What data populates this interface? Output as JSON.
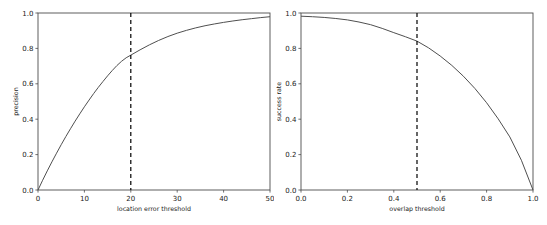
{
  "figure": {
    "background": "#ffffff",
    "curve_color": "#4f4f4f",
    "axis_color": "#4d4d4d",
    "threshold_color": "#000000",
    "width": 547,
    "height": 225
  },
  "chart_data": [
    {
      "type": "line",
      "panel": "left",
      "title": "",
      "xlabel": "location error threshold",
      "ylabel": "precision",
      "xlim": [
        0,
        50
      ],
      "ylim": [
        0.0,
        1.0
      ],
      "xticks": [
        0,
        10,
        20,
        30,
        40,
        50
      ],
      "xtick_labels": [
        "0",
        "10",
        "20",
        "30",
        "40",
        "50"
      ],
      "yticks": [
        0.0,
        0.2,
        0.4,
        0.6,
        0.8,
        1.0
      ],
      "ytick_labels": [
        "0.0",
        "0.2",
        "0.4",
        "0.6",
        "0.8",
        "1.0"
      ],
      "grid": false,
      "legend": false,
      "annotations": [
        {
          "type": "vline",
          "x": 20,
          "style": "dashed",
          "color": "#000000",
          "label": "location error threshold = 20"
        }
      ],
      "series": [
        {
          "name": "precision",
          "x": [
            0,
            1,
            2,
            3,
            4,
            5,
            6,
            7,
            8,
            9,
            10,
            11,
            12,
            13,
            14,
            15,
            16,
            17,
            18,
            19,
            20,
            22,
            24,
            26,
            28,
            30,
            32,
            34,
            36,
            38,
            40,
            42,
            44,
            46,
            48,
            50
          ],
          "values": [
            0.0,
            0.055,
            0.108,
            0.159,
            0.208,
            0.256,
            0.302,
            0.346,
            0.389,
            0.43,
            0.47,
            0.508,
            0.545,
            0.58,
            0.613,
            0.645,
            0.675,
            0.703,
            0.727,
            0.747,
            0.762,
            0.792,
            0.82,
            0.845,
            0.867,
            0.886,
            0.902,
            0.916,
            0.928,
            0.938,
            0.947,
            0.955,
            0.962,
            0.968,
            0.974,
            0.979
          ]
        }
      ]
    },
    {
      "type": "line",
      "panel": "right",
      "title": "",
      "xlabel": "overlap threshold",
      "ylabel": "success rate",
      "xlim": [
        0.0,
        1.0
      ],
      "ylim": [
        0.0,
        1.0
      ],
      "xticks": [
        0.0,
        0.2,
        0.4,
        0.6,
        0.8,
        1.0
      ],
      "xtick_labels": [
        "0.0",
        "0.2",
        "0.4",
        "0.6",
        "0.8",
        "1.0"
      ],
      "yticks": [
        0.0,
        0.2,
        0.4,
        0.6,
        0.8,
        1.0
      ],
      "ytick_labels": [
        "0.0",
        "0.2",
        "0.4",
        "0.6",
        "0.8",
        "1.0"
      ],
      "grid": false,
      "legend": false,
      "annotations": [
        {
          "type": "vline",
          "x": 0.5,
          "style": "dashed",
          "color": "#000000",
          "label": "overlap threshold = 0.5"
        }
      ],
      "series": [
        {
          "name": "success rate",
          "x": [
            0.0,
            0.05,
            0.1,
            0.15,
            0.2,
            0.25,
            0.3,
            0.35,
            0.4,
            0.45,
            0.5,
            0.55,
            0.6,
            0.65,
            0.7,
            0.75,
            0.8,
            0.85,
            0.9,
            0.95,
            1.0
          ],
          "values": [
            0.982,
            0.979,
            0.975,
            0.969,
            0.961,
            0.949,
            0.934,
            0.913,
            0.889,
            0.866,
            0.841,
            0.803,
            0.757,
            0.704,
            0.643,
            0.573,
            0.493,
            0.402,
            0.3,
            0.168,
            0.0
          ]
        }
      ]
    }
  ]
}
